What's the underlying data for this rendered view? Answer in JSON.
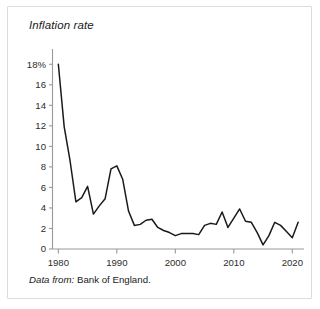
{
  "figure": {
    "title": "Inflation rate",
    "source_label": "Data from:",
    "source_value": "Bank of England.",
    "card_background": "#ffffff",
    "border_color": "#dcdcdc",
    "line_color": "#1a1a1a",
    "axis_color": "#999999",
    "text_color": "#1a1a1a"
  },
  "chart_data": {
    "type": "line",
    "title": "Inflation rate",
    "xlabel": "",
    "ylabel": "Inflation rate",
    "xlim": [
      1979,
      2022
    ],
    "ylim": [
      0,
      19
    ],
    "grid": false,
    "legend": false,
    "y_unit": "%",
    "y_ticks": [
      0,
      2,
      4,
      6,
      8,
      10,
      12,
      14,
      16,
      18
    ],
    "y_tick_labels": [
      "0",
      "2",
      "4",
      "6",
      "8",
      "10",
      "12",
      "14",
      "16",
      "18%"
    ],
    "x_ticks": [
      1980,
      1990,
      2000,
      2010,
      2020
    ],
    "x_tick_labels": [
      "1980",
      "1990",
      "2000",
      "2010",
      "2020"
    ],
    "x": [
      1980,
      1981,
      1982,
      1983,
      1984,
      1985,
      1986,
      1987,
      1988,
      1989,
      1990,
      1991,
      1992,
      1993,
      1994,
      1995,
      1996,
      1997,
      1998,
      1999,
      2000,
      2001,
      2002,
      2003,
      2004,
      2005,
      2006,
      2007,
      2008,
      2009,
      2010,
      2011,
      2012,
      2013,
      2014,
      2015,
      2016,
      2017,
      2018,
      2019,
      2020,
      2021
    ],
    "values": [
      18.0,
      11.9,
      8.6,
      4.6,
      5.0,
      6.1,
      3.4,
      4.2,
      4.9,
      7.8,
      8.1,
      6.8,
      3.7,
      2.3,
      2.4,
      2.8,
      2.9,
      2.1,
      1.8,
      1.6,
      1.3,
      1.5,
      1.5,
      1.5,
      1.4,
      2.3,
      2.5,
      2.4,
      3.6,
      2.1,
      3.0,
      3.9,
      2.7,
      2.6,
      1.6,
      0.4,
      1.3,
      2.6,
      2.3,
      1.7,
      1.1,
      2.6
    ],
    "series": [
      {
        "name": "Inflation rate",
        "values": [
          18.0,
          11.9,
          8.6,
          4.6,
          5.0,
          6.1,
          3.4,
          4.2,
          4.9,
          7.8,
          8.1,
          6.8,
          3.7,
          2.3,
          2.4,
          2.8,
          2.9,
          2.1,
          1.8,
          1.6,
          1.3,
          1.5,
          1.5,
          1.5,
          1.4,
          2.3,
          2.5,
          2.4,
          3.6,
          2.1,
          3.0,
          3.9,
          2.7,
          2.6,
          1.6,
          0.4,
          1.3,
          2.6,
          2.3,
          1.7,
          1.1,
          2.6
        ]
      }
    ]
  }
}
